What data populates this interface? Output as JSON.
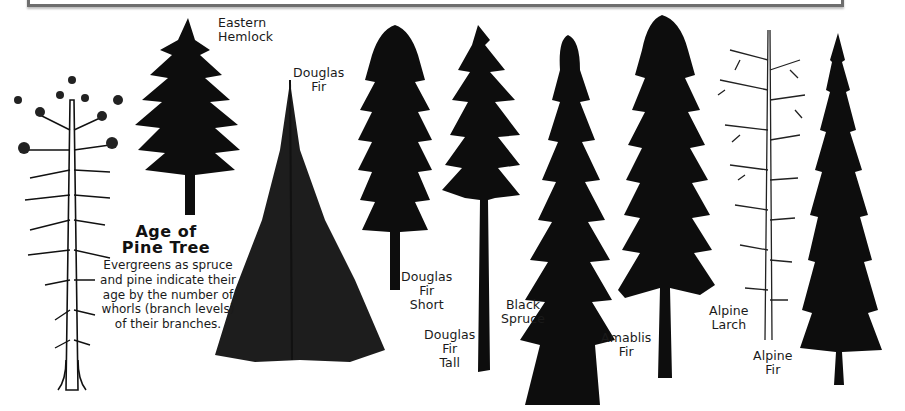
{
  "frame": {
    "border_color": "#6e6e6e"
  },
  "info_box": {
    "title_line1": "Age of",
    "title_line2": "Pine Tree",
    "body": "Evergreens as spruce and pine indicate their age by the number of whorls (branch levels) of their branches."
  },
  "trees": [
    {
      "id": "pine",
      "label": "",
      "style": "line-drawing"
    },
    {
      "id": "eastern-hemlock",
      "label": "Eastern\nHemlock"
    },
    {
      "id": "douglas-fir",
      "label": "Douglas\nFir"
    },
    {
      "id": "douglas-fir-short",
      "label": "Douglas\nFir\nShort"
    },
    {
      "id": "douglas-fir-tall",
      "label": "Douglas\nFir\nTall"
    },
    {
      "id": "black-spruce",
      "label": "Black\nSpruce"
    },
    {
      "id": "amablis-fir",
      "label": "Amablis\nFir"
    },
    {
      "id": "alpine-larch",
      "label": "Alpine\nLarch"
    },
    {
      "id": "alpine-fir",
      "label": "Alpine\nFir"
    }
  ],
  "colors": {
    "silhouette": "#0d0d0d",
    "background": "#ffffff"
  }
}
